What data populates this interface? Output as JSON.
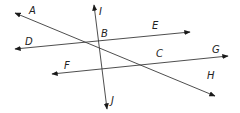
{
  "diagram": {
    "type": "geometry-lines",
    "lines": [
      {
        "id": "AH",
        "ends": [
          "A",
          "H"
        ],
        "through": [
          "B",
          "C"
        ]
      },
      {
        "id": "DE",
        "ends": [
          "D",
          "E"
        ],
        "through": [
          "B"
        ]
      },
      {
        "id": "FG",
        "ends": [
          "F",
          "G"
        ],
        "through": [
          "C"
        ]
      },
      {
        "id": "IJ",
        "ends": [
          "I",
          "J"
        ],
        "through": [
          "B"
        ]
      }
    ],
    "labels": {
      "A": "A",
      "B": "B",
      "C": "C",
      "D": "D",
      "E": "E",
      "F": "F",
      "G": "G",
      "H": "H",
      "I": "I",
      "J": "J"
    },
    "stroke_color": "#3a3a3a",
    "label_color": "#222222"
  }
}
